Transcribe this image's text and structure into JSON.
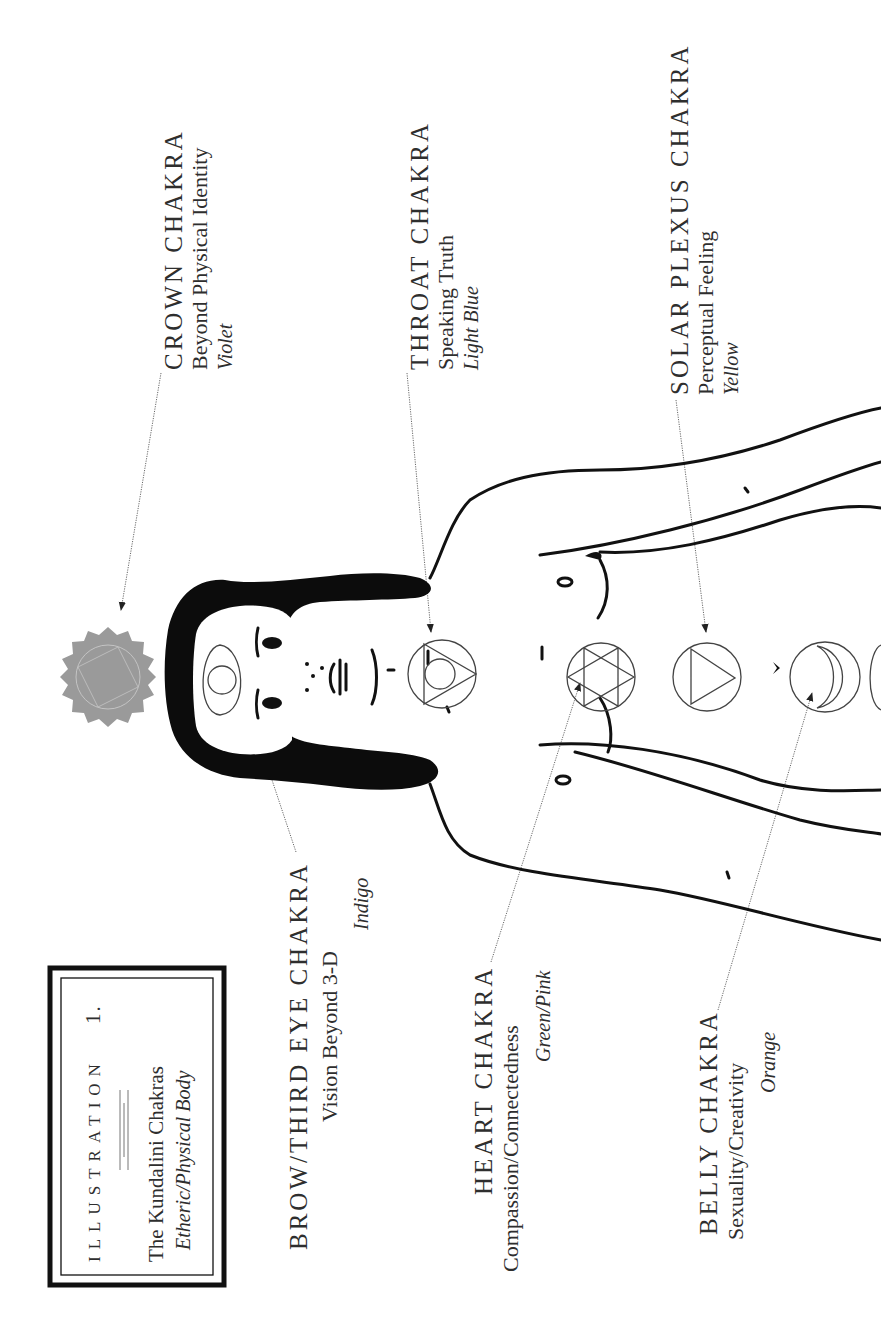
{
  "illustration_box": {
    "heading": "ILLUSTRATION",
    "number": "1.",
    "title": "The Kundalini Chakras",
    "subtitle": "Etheric/Physical Body"
  },
  "chakras": [
    {
      "id": "crown",
      "name": "CROWN CHAKRA",
      "meaning": "Beyond Physical Identity",
      "color_name": "Violet",
      "symbol": "lotus-icon"
    },
    {
      "id": "brow",
      "name": "BROW/THIRD EYE CHAKRA",
      "meaning": "Vision Beyond 3-D",
      "color_name": "Indigo",
      "symbol": "eye-icon"
    },
    {
      "id": "throat",
      "name": "THROAT CHAKRA",
      "meaning": "Speaking Truth",
      "color_name": "Light Blue",
      "symbol": "triangle-circle-icon"
    },
    {
      "id": "heart",
      "name": "HEART CHAKRA",
      "meaning": "Compassion/Connectedness",
      "color_name": "Green/Pink",
      "symbol": "hexagram-icon"
    },
    {
      "id": "solar",
      "name": "SOLAR PLEXUS CHAKRA",
      "meaning": "Perceptual Feeling",
      "color_name": "Yellow",
      "symbol": "triangle-icon"
    },
    {
      "id": "belly",
      "name": "BELLY CHAKRA",
      "meaning": "Sexuality/Creativity",
      "color_name": "Orange",
      "symbol": "crescent-icon"
    }
  ],
  "colors": {
    "ink": "#111111",
    "text": "#2e2e2e",
    "lotus_fill": "#9a9a9a",
    "paper": "#ffffff"
  }
}
